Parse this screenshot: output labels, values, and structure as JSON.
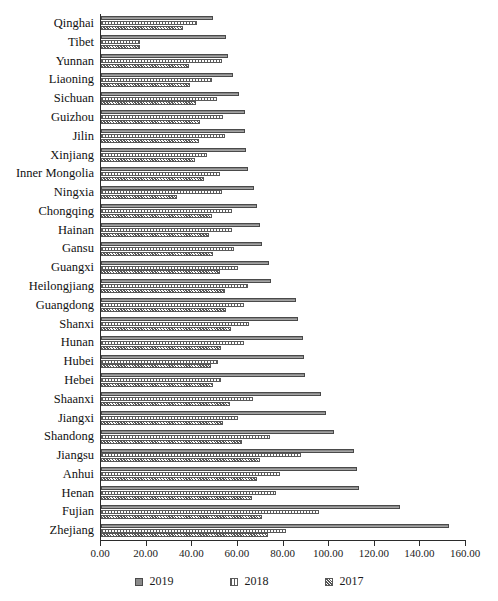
{
  "chart_data": {
    "type": "bar",
    "orientation": "horizontal",
    "title": "",
    "xlabel": "",
    "ylabel": "",
    "xlim": [
      0,
      160
    ],
    "xticks": [
      "0.00",
      "20.00",
      "40.00",
      "60.00",
      "80.00",
      "100.00",
      "120.00",
      "140.00",
      "160.00"
    ],
    "grid": false,
    "legend_position": "bottom",
    "categories": [
      "Qinghai",
      "Tibet",
      "Yunnan",
      "Liaoning",
      "Sichuan",
      "Guizhou",
      "Jilin",
      "Xinjiang",
      "Inner Mongolia",
      "Ningxia",
      "Chongqing",
      "Hainan",
      "Gansu",
      "Guangxi",
      "Heilongjiang",
      "Guangdong",
      "Shanxi",
      "Hunan",
      "Hubei",
      "Hebei",
      "Shaanxi",
      "Jiangxi",
      "Shandong",
      "Jiangsu",
      "Anhui",
      "Henan",
      "Fujian",
      "Zhejiang"
    ],
    "series": [
      {
        "name": "2019",
        "color": "#8a8a8a",
        "values": [
          49.0,
          55.0,
          55.5,
          58.0,
          60.5,
          63.0,
          63.0,
          63.5,
          64.5,
          67.0,
          68.5,
          69.5,
          70.5,
          73.5,
          74.5,
          85.5,
          86.5,
          88.5,
          89.0,
          89.5,
          96.5,
          98.5,
          102.0,
          111.0,
          112.0,
          113.0,
          131.0,
          152.5
        ]
      },
      {
        "name": "2018",
        "color": "#e2e2e2",
        "values": [
          42.0,
          17.0,
          53.0,
          48.5,
          51.0,
          53.5,
          54.5,
          46.5,
          52.0,
          53.0,
          57.5,
          57.5,
          58.5,
          60.0,
          64.5,
          62.5,
          65.0,
          62.5,
          51.5,
          52.5,
          66.5,
          60.0,
          74.0,
          87.5,
          78.5,
          76.5,
          95.5,
          81.0
        ]
      },
      {
        "name": "2017",
        "color": "#d8d8d8",
        "values": [
          36.0,
          17.0,
          38.5,
          39.0,
          41.5,
          43.5,
          43.0,
          41.0,
          45.0,
          33.5,
          48.5,
          47.5,
          49.0,
          52.0,
          54.5,
          55.0,
          57.0,
          52.5,
          48.0,
          49.0,
          56.5,
          53.5,
          62.0,
          69.5,
          68.5,
          66.0,
          70.5,
          73.0
        ]
      }
    ]
  },
  "legend": {
    "items": [
      {
        "label": "2019",
        "swatch": "series-2019-swatch"
      },
      {
        "label": "2018",
        "swatch": "series-2018-swatch"
      },
      {
        "label": "2017",
        "swatch": "series-2017-swatch"
      }
    ]
  }
}
